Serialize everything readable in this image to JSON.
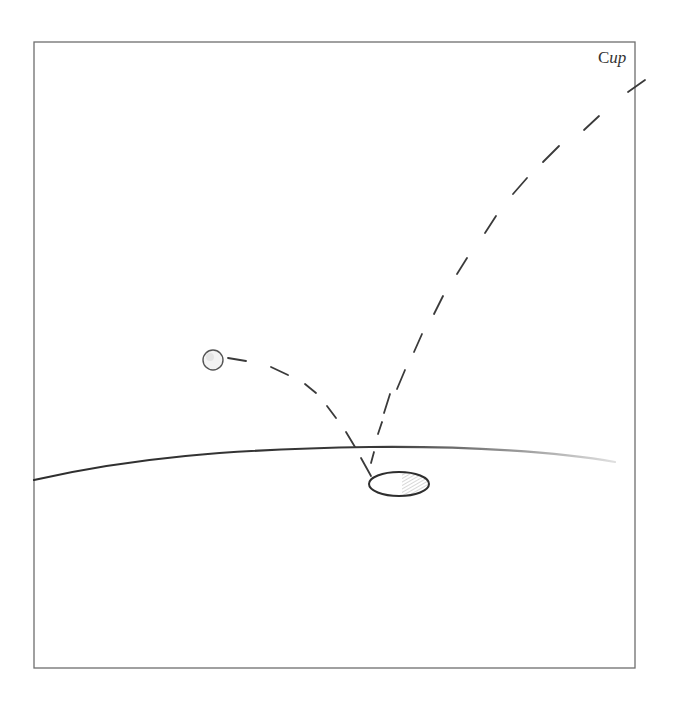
{
  "diagram": {
    "type": "sketch",
    "frame": {
      "x": 34,
      "y": 42,
      "width": 601,
      "height": 626,
      "stroke": "#6e6e6e"
    },
    "labels": {
      "cup": {
        "prefix": "C",
        "suffix": "up",
        "x": 598,
        "y": 49
      }
    },
    "colors": {
      "ink": "#2e2e2e",
      "ink_light": "#555555",
      "frame": "#6e6e6e",
      "hatch": "#bdbdbd",
      "background": "#ffffff"
    },
    "elements": {
      "ball": {
        "cx": 213,
        "cy": 360,
        "r": 10
      },
      "hole": {
        "cx": 399,
        "cy": 484,
        "rx": 30,
        "ry": 12
      },
      "ground": {
        "from": [
          34,
          480
        ],
        "to": [
          615,
          462
        ]
      },
      "trajectory_1": {
        "description": "dashed arc from ball down into hole"
      },
      "trajectory_2": {
        "description": "dashed arc from hole rising toward Cup at top right"
      }
    }
  }
}
